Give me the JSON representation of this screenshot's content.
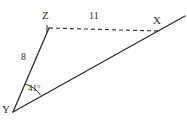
{
  "figure": {
    "type": "geometry-diagram",
    "shape": "triangle",
    "background_color": "#ffffff",
    "stroke_color": "#2b2b2b",
    "label_color": "#2b2b2b"
  },
  "vertices": [
    {
      "name": "Z",
      "label": "Z",
      "x": 49,
      "y": 28,
      "label_x": 42,
      "label_y": 10
    },
    {
      "name": "X",
      "label": "X",
      "x": 158,
      "y": 31,
      "label_x": 153,
      "label_y": 15
    },
    {
      "name": "Y",
      "label": "Y",
      "x": 13,
      "y": 112,
      "label_x": 2,
      "label_y": 104
    }
  ],
  "sides": [
    {
      "name": "ZX",
      "from": "Z",
      "to": "X",
      "style": "dashed",
      "length_label": "11",
      "label_x": 89,
      "label_y": 11
    },
    {
      "name": "ZY",
      "from": "Z",
      "to": "Y",
      "style": "solid",
      "length_label": "8",
      "label_x": 21,
      "label_y": 52
    },
    {
      "name": "YX",
      "from": "Y",
      "to": "X",
      "style": "solid",
      "length_label": "",
      "label_x": 0,
      "label_y": 0
    }
  ],
  "ray_extension": {
    "name": "YX-extended",
    "from_x": 158,
    "from_y": 31,
    "to_x": 185,
    "to_y": 16
  },
  "angles": [
    {
      "name": "angle-Y",
      "at_vertex": "Y",
      "label": "41°",
      "value": 41,
      "unit": "degrees",
      "label_x": 28,
      "label_y": 84,
      "arc_radius": 28
    }
  ]
}
